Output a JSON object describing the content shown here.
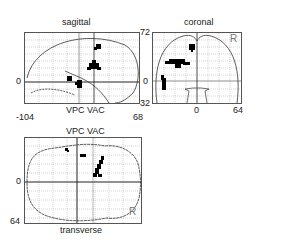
{
  "figure": {
    "sagittal": {
      "title": "sagittal",
      "x_min": "-104",
      "x_max": "68",
      "y_max": "72",
      "y_min": "32",
      "zero": "0",
      "landmark_label": "VPC VAC"
    },
    "coronal": {
      "title": "coronal",
      "y_max": "72",
      "zero_y": "0",
      "y_min": "32",
      "x_zero": "0",
      "x_max": "64",
      "side": "R"
    },
    "transverse": {
      "title": "transverse",
      "top_label": "VPC VAC",
      "zero": "0",
      "y_max": "64",
      "side": "R"
    }
  },
  "colors": {
    "grid": "#9a9a9a",
    "outline": "#333333",
    "blob": "#000000"
  }
}
